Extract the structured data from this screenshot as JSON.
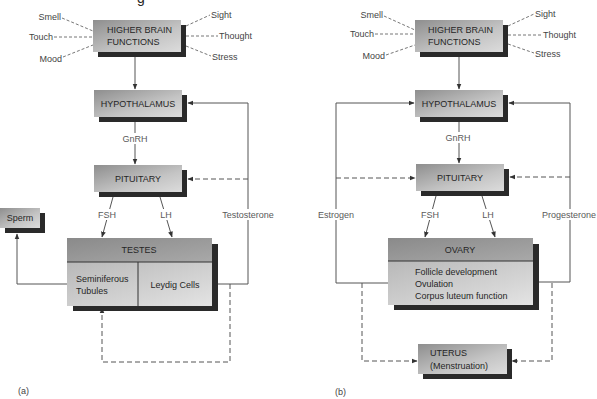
{
  "title_fragment": "g",
  "panels": {
    "a": {
      "label": "(a)",
      "higher_brain": {
        "line1": "HIGHER BRAIN",
        "line2": "FUNCTIONS"
      },
      "inputs_left": [
        "Smell",
        "Touch",
        "Mood"
      ],
      "inputs_right": [
        "Sight",
        "Thought",
        "Stress"
      ],
      "hypothalamus": "HYPOTHALAMUS",
      "gnrh": "GnRH",
      "pituitary": "PITUITARY",
      "fsh": "FSH",
      "lh": "LH",
      "feedback": "Testosterone",
      "gonad": "TESTES",
      "gonad_cells": {
        "left_line1": "Seminiferous",
        "left_line2": "Tubules",
        "right": "Leydig Cells"
      },
      "output": "Sperm"
    },
    "b": {
      "label": "(b)",
      "higher_brain": {
        "line1": "HIGHER BRAIN",
        "line2": "FUNCTIONS"
      },
      "inputs_left": [
        "Smell",
        "Touch",
        "Mood"
      ],
      "inputs_right": [
        "Sight",
        "Thought",
        "Stress"
      ],
      "hypothalamus": "HYPOTHALAMUS",
      "gnrh": "GnRH",
      "pituitary": "PITUITARY",
      "fsh": "FSH",
      "lh": "LH",
      "feedback_left": "Estrogen",
      "feedback_right": "Progesterone",
      "gonad": "OVARY",
      "gonad_functions": [
        "Follicle development",
        "Ovulation",
        "Corpus luteum function"
      ],
      "target": {
        "line1": "UTERUS",
        "line2": "(Menstruation)"
      }
    }
  },
  "colors": {
    "box_dark": "#8c8c8c",
    "box_light": "#d9d9d9",
    "shadow": "#2a2a2a",
    "line": "#555555"
  }
}
